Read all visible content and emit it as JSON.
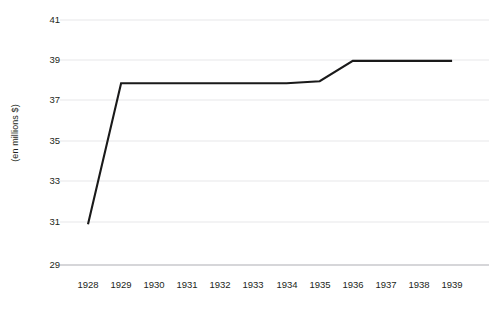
{
  "chart_data": {
    "type": "line",
    "title": "",
    "subtitle": "",
    "xlabel": "",
    "ylabel": "(en millions $)",
    "categories": [
      "1928",
      "1929",
      "1930",
      "1931",
      "1932",
      "1933",
      "1934",
      "1935",
      "1936",
      "1937",
      "1938",
      "1939"
    ],
    "x": [
      1928,
      1929,
      1930,
      1931,
      1932,
      1933,
      1934,
      1935,
      1936,
      1937,
      1938,
      1939
    ],
    "values": [
      31,
      37.9,
      37.9,
      37.9,
      37.9,
      37.9,
      37.9,
      38,
      39,
      39,
      39,
      39
    ],
    "series": [
      {
        "name": "",
        "values": [
          31,
          37.9,
          37.9,
          37.9,
          37.9,
          37.9,
          37.9,
          38,
          39,
          39,
          39,
          39
        ]
      }
    ],
    "ylim": [
      29,
      41
    ],
    "yticks": [
      29,
      31,
      33,
      35,
      37,
      39,
      41
    ],
    "ytick_labels": [
      "29",
      "31",
      "33",
      "35",
      "37",
      "39",
      "41"
    ],
    "xtick_labels": [
      "1928",
      "1929",
      "1930",
      "1931",
      "1932",
      "1933",
      "1934",
      "1935",
      "1936",
      "1937",
      "1938",
      "1939"
    ],
    "grid": "horizontal",
    "legend": "none",
    "annotations": [],
    "colors": {
      "line": "#1a1a1a",
      "grid": "#e8e8ea",
      "axis": "#c9c9cd",
      "text": "#231f20",
      "background": "#ffffff"
    }
  }
}
